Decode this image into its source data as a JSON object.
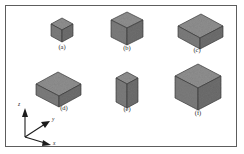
{
  "figure": {
    "title": "",
    "background_color": "#ffffff",
    "frame_color": "#5d5d5d",
    "face_colors": {
      "top": "#8f8f8f",
      "left": "#7a7a7a",
      "right": "#6e6e6e",
      "edge": "#3a3a3a"
    },
    "axes_triad": {
      "z_label": "z",
      "y_label": "y",
      "x_label": "x",
      "origin": {
        "x": 25,
        "y": 137
      },
      "description": "right-handed isometric triad: z up, y to upper-right, x to lower-right"
    },
    "shapes": [
      {
        "id": "a",
        "label": "(a)",
        "kind": "cube",
        "dims": {
          "x": 1,
          "y": 1,
          "z": 1
        },
        "unit": 11,
        "center": {
          "x": 62,
          "y": 32
        },
        "label_pos": {
          "x": 62,
          "y": 46
        }
      },
      {
        "id": "b",
        "label": "(b)",
        "kind": "cube",
        "dims": {
          "x": 1.45,
          "y": 1.45,
          "z": 1.45
        },
        "unit": 11,
        "center": {
          "x": 127,
          "y": 30
        },
        "label_pos": {
          "x": 127,
          "y": 47
        }
      },
      {
        "id": "c",
        "label": "(c)",
        "kind": "box-elongated-y",
        "dims": {
          "x": 1,
          "y": 2,
          "z": 1
        },
        "unit": 11,
        "center": {
          "x": 197,
          "y": 33
        },
        "label_pos": {
          "x": 197,
          "y": 48
        }
      },
      {
        "id": "d",
        "label": "(d)",
        "kind": "box-elongated-x",
        "dims": {
          "x": 2,
          "y": 1,
          "z": 1
        },
        "unit": 11,
        "center": {
          "x": 62,
          "y": 92
        },
        "label_pos": {
          "x": 64,
          "y": 107
        }
      },
      {
        "id": "e",
        "label": "(e)",
        "kind": "box-tall-z",
        "dims": {
          "x": 1,
          "y": 1,
          "z": 2
        },
        "unit": 11,
        "center": {
          "x": 127,
          "y": 90
        },
        "label_pos": {
          "x": 127,
          "y": 108
        }
      },
      {
        "id": "f",
        "label": "(f)",
        "kind": "cube-large",
        "dims": {
          "x": 2,
          "y": 2,
          "z": 2
        },
        "unit": 11,
        "center": {
          "x": 198,
          "y": 89
        },
        "label_pos": {
          "x": 198,
          "y": 112
        }
      }
    ]
  }
}
